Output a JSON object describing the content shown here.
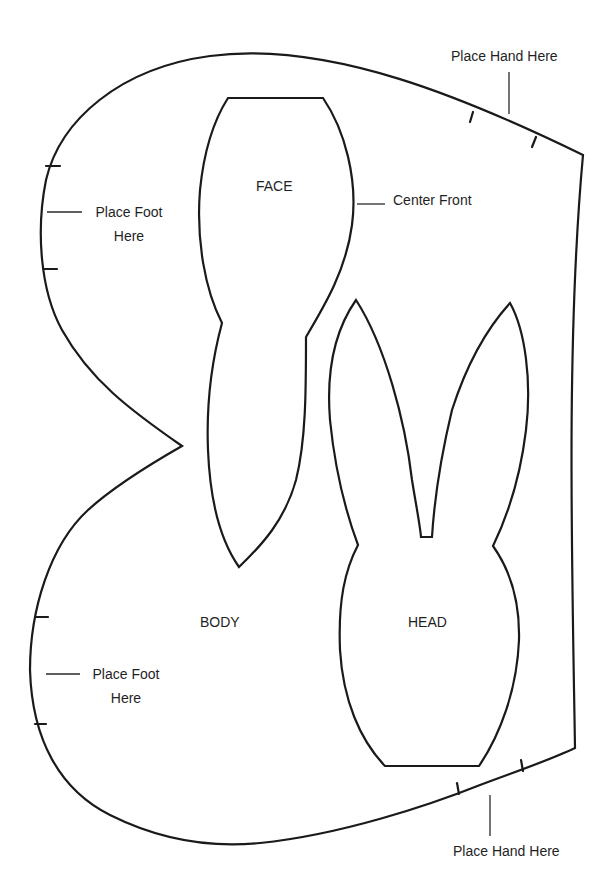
{
  "colors": {
    "line": "#1a1a1a",
    "background": "#ffffff"
  },
  "pieces": {
    "face": {
      "label": "FACE"
    },
    "body": {
      "label": "BODY"
    },
    "head": {
      "label": "HEAD"
    }
  },
  "annotations": {
    "hand_top": "Place Hand Here",
    "hand_bottom": "Place Hand Here",
    "foot_top_line1": "Place Foot",
    "foot_top_line2": "Here",
    "foot_bottom_line1": "Place Foot",
    "foot_bottom_line2": "Here",
    "center_front": "Center Front"
  }
}
